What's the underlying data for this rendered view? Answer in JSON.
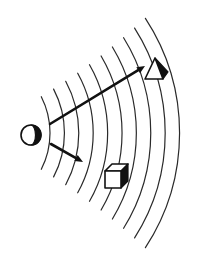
{
  "diagram": {
    "colors": {
      "ink": "#111111",
      "wave": "#2a2a2a",
      "background": "#ffffff"
    },
    "source": {
      "icon": "half-filled-circle",
      "cx": 31,
      "cy": 135,
      "r": 10
    },
    "waves": {
      "count": 10,
      "center": [
        -30,
        133
      ],
      "first_radius": 80,
      "spacing": 14.4,
      "start_angle_deg": -27,
      "end_angle_deg": 27
    },
    "arrows": [
      {
        "name": "long-arrow",
        "from": [
          50,
          124
        ],
        "to": [
          145,
          66
        ]
      },
      {
        "name": "short-arrow",
        "from": [
          51,
          144
        ],
        "to": [
          83,
          162
        ]
      }
    ],
    "objects": [
      {
        "name": "triangular-prism",
        "shape": "triangle"
      },
      {
        "name": "cube",
        "shape": "cube"
      }
    ]
  }
}
